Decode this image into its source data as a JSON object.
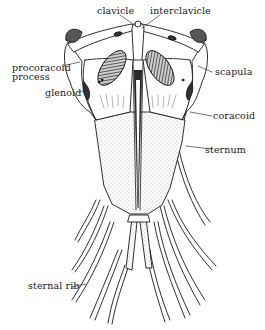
{
  "diagram": {
    "labels": {
      "clavicle": "clavicle",
      "interclavicle": "interclavicle",
      "procoracoid_line1": "procoracoid",
      "procoracoid_line2": "process",
      "glenoid": "glenoid",
      "scapula": "scapula",
      "coracoid": "coracoid",
      "sternum": "sternum",
      "sternal_rib": "sternal rib"
    },
    "colors": {
      "ink": "#1a1a1a",
      "background": "#ffffff",
      "stipple": "#9a9a9a",
      "fenestra_fill": "#3a3a3a"
    }
  }
}
